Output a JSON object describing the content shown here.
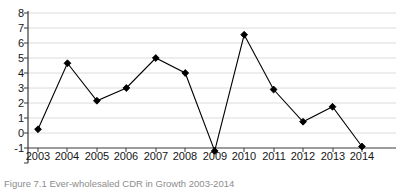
{
  "chart_data": {
    "type": "line",
    "title": "",
    "xlabel": "",
    "ylabel": "",
    "categories": [
      "2003",
      "2004",
      "2005",
      "2006",
      "2007",
      "2008",
      "2009",
      "2010",
      "2011",
      "2012",
      "2013",
      "2014"
    ],
    "values": [
      1.25,
      5.65,
      3.15,
      4.0,
      6.0,
      5.0,
      -0.2,
      7.55,
      3.9,
      1.75,
      2.75,
      0.1
    ],
    "ylim": [
      -1,
      8
    ],
    "y_ticks": [
      "8",
      "7",
      "6",
      "5",
      "4",
      "3",
      "2",
      "1",
      "0",
      "-1"
    ],
    "y_tick_values": [
      8,
      7,
      6,
      5,
      4,
      3,
      2,
      1,
      0,
      -1
    ],
    "grid": "horizontal",
    "legend": "none",
    "series_color": "#000000",
    "marker": "diamond",
    "gridline_color": "#d9d9d9",
    "axis_color": "#3a3a3a"
  },
  "caption": {
    "text": "Figure 7.1  Ever-wholesaled CDR in Growth 2003-2014"
  }
}
